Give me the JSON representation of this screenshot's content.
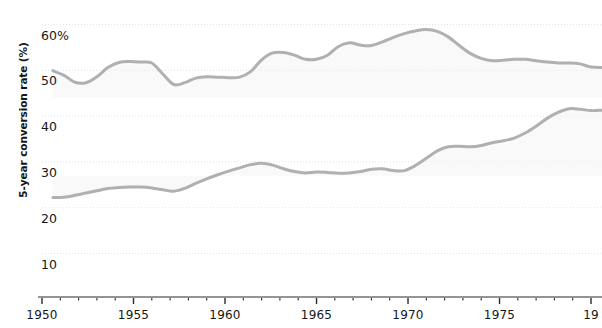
{
  "chart_data": {
    "type": "line",
    "title": "",
    "subtitle": "",
    "xlabel": "",
    "ylabel": "5-year conversion rate (%)",
    "xlim": [
      1950,
      1980.6
    ],
    "ylim": [
      0,
      62
    ],
    "grid": true,
    "grid_style": "dotted-horizontal",
    "legend": "none",
    "x_major_ticks": [
      1950,
      1955,
      1960,
      1965,
      1970,
      1975,
      1980
    ],
    "x_major_tick_labels": [
      "1950",
      "1955",
      "1960",
      "1965",
      "1970",
      "1975",
      "19"
    ],
    "x_minor_tick_step": 1,
    "y_ticks": [
      10,
      20,
      30,
      40,
      50,
      60
    ],
    "y_tick_labels": [
      "10",
      "20",
      "30",
      "40",
      "50",
      "60%"
    ],
    "line_color": "#b0b0b0",
    "fill_color": "#f4f4f4",
    "background_color": "#ffffff",
    "axis_color": "#2a2a2a",
    "gridline_color": "#e2e2e2",
    "x": [
      1950.6,
      1951.2,
      1951.8,
      1952.4,
      1953.0,
      1953.6,
      1954.2,
      1954.8,
      1955.4,
      1956.0,
      1956.6,
      1957.2,
      1957.8,
      1958.4,
      1959.0,
      1959.6,
      1960.2,
      1960.8,
      1961.4,
      1962.0,
      1962.6,
      1963.2,
      1963.8,
      1964.4,
      1965.0,
      1965.6,
      1966.2,
      1966.8,
      1967.4,
      1968.0,
      1968.6,
      1969.2,
      1969.8,
      1970.4,
      1971.0,
      1971.6,
      1972.2,
      1972.8,
      1973.4,
      1974.0,
      1974.6,
      1975.2,
      1975.8,
      1976.4,
      1977.0,
      1977.6,
      1978.2,
      1978.8,
      1979.4,
      1980.0,
      1980.6
    ],
    "series": [
      {
        "name": "upper",
        "values": [
          49.9,
          48.9,
          47.4,
          47.3,
          48.6,
          50.6,
          51.7,
          51.9,
          51.8,
          51.6,
          49.2,
          46.9,
          47.3,
          48.3,
          48.6,
          48.5,
          48.4,
          48.5,
          49.7,
          52.3,
          53.8,
          53.9,
          53.3,
          52.4,
          52.4,
          53.3,
          55.2,
          56.0,
          55.5,
          55.4,
          56.2,
          57.2,
          58.0,
          58.6,
          58.9,
          58.5,
          57.3,
          55.4,
          53.7,
          52.6,
          52.1,
          52.2,
          52.4,
          52.4,
          52.1,
          51.8,
          51.6,
          51.6,
          51.4,
          50.7,
          50.6
        ]
      },
      {
        "name": "lower",
        "values": [
          22.2,
          22.3,
          22.7,
          23.2,
          23.7,
          24.2,
          24.4,
          24.5,
          24.5,
          24.3,
          23.9,
          23.6,
          24.2,
          25.3,
          26.3,
          27.2,
          28.0,
          28.7,
          29.4,
          29.7,
          29.3,
          28.5,
          27.9,
          27.6,
          27.8,
          27.7,
          27.5,
          27.6,
          27.9,
          28.4,
          28.5,
          28.1,
          28.1,
          29.2,
          30.8,
          32.4,
          33.3,
          33.4,
          33.3,
          33.6,
          34.2,
          34.6,
          35.2,
          36.3,
          37.8,
          39.5,
          40.8,
          41.6,
          41.5,
          41.2,
          41.3
        ]
      }
    ]
  }
}
